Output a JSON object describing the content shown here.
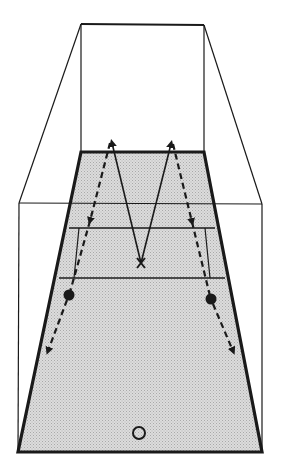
{
  "diagram": {
    "title": "",
    "type": "court-drill-perspective",
    "colors": {
      "background": "#ffffff",
      "line": "#1a1a1a",
      "court_fill": "#d6d6d6",
      "court_dot": "#b8b8b8"
    },
    "structure": {
      "back_wall": {
        "top_left": [
          81,
          24
        ],
        "top_right": [
          204,
          25
        ],
        "bottom_y": 152
      },
      "front_frame": {
        "top_left": [
          19,
          203
        ],
        "top_right": [
          262,
          204
        ],
        "bottom_y": 452
      },
      "court": {
        "top_left": [
          81,
          152
        ],
        "top_right": [
          204,
          152
        ],
        "bottom_left": [
          18,
          452
        ],
        "bottom_right": [
          262,
          452
        ]
      },
      "court_lines_y": [
        203,
        228,
        278
      ],
      "service_box_verticals": [
        {
          "x_top": 79,
          "x_bottom": 73,
          "y1": 228,
          "y2": 278
        },
        {
          "x_top": 205,
          "x_bottom": 211,
          "y1": 228,
          "y2": 278
        }
      ]
    },
    "markers": [
      {
        "kind": "cross",
        "label": "X",
        "position": [
          141,
          263
        ]
      },
      {
        "kind": "filled-dot",
        "label": "player-left",
        "position": [
          69,
          295
        ]
      },
      {
        "kind": "filled-dot",
        "label": "player-right",
        "position": [
          211,
          299
        ]
      },
      {
        "kind": "hollow-circle",
        "label": "ball-start",
        "position": [
          139,
          433
        ]
      }
    ],
    "paths": [
      {
        "style": "solid",
        "points": [
          [
            141,
            263
          ],
          [
            111,
            139
          ]
        ],
        "arrow": "end"
      },
      {
        "style": "solid",
        "points": [
          [
            141,
            263
          ],
          [
            172,
            140
          ]
        ],
        "arrow": "end"
      },
      {
        "style": "dashed",
        "points": [
          [
            111,
            139
          ],
          [
            69,
            295
          ]
        ],
        "arrow": "mid"
      },
      {
        "style": "dashed",
        "points": [
          [
            172,
            140
          ],
          [
            211,
            299
          ]
        ],
        "arrow": "mid"
      },
      {
        "style": "dashed",
        "points": [
          [
            69,
            295
          ],
          [
            47,
            355
          ]
        ],
        "arrow": "end"
      },
      {
        "style": "dashed",
        "points": [
          [
            211,
            299
          ],
          [
            234,
            355
          ]
        ],
        "arrow": "end"
      }
    ]
  }
}
